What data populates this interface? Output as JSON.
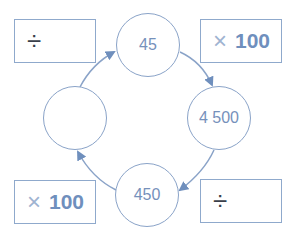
{
  "diagram": {
    "colors": {
      "stroke": "#8aa3c8",
      "arrow": "#6f8fbd",
      "text": "#7691bb",
      "box_border": "#8fa9cc"
    },
    "circles": [
      {
        "id": "top",
        "value": "45"
      },
      {
        "id": "right",
        "value": "4 500"
      },
      {
        "id": "bottom",
        "value": "450"
      },
      {
        "id": "left",
        "value": ""
      }
    ],
    "operation_boxes": [
      {
        "id": "top-left",
        "operator": "÷",
        "operand": ""
      },
      {
        "id": "top-right",
        "operator": "×",
        "operand": "100"
      },
      {
        "id": "bottom-right",
        "operator": "÷",
        "operand": ""
      },
      {
        "id": "bottom-left",
        "operator": "×",
        "operand": "100"
      }
    ],
    "flow_direction": "clockwise"
  }
}
